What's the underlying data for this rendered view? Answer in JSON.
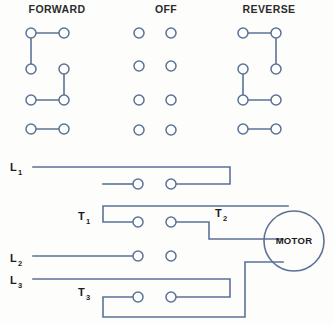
{
  "diagram": {
    "type": "electrical-switch-wiring-diagram",
    "background_color": "#fdfdfc",
    "wire_color": "#5b7296",
    "text_color": "#1b1b1b",
    "switch_positions": [
      {
        "id": "forward",
        "title": "FORWARD",
        "title_x": 57,
        "title_y": 13,
        "left_col_x": 31,
        "right_col_x": 64,
        "row_y": [
          33,
          69,
          100,
          129
        ],
        "contact_radius": 5,
        "jumpers": [
          {
            "from": [
              31,
              33
            ],
            "to": [
              64,
              33
            ]
          },
          {
            "from": [
              31,
              33
            ],
            "to": [
              31,
              69
            ]
          },
          {
            "from": [
              64,
              69
            ],
            "to": [
              64,
              100
            ]
          },
          {
            "from": [
              31,
              100
            ],
            "to": [
              64,
              100
            ]
          },
          {
            "from": [
              31,
              129
            ],
            "to": [
              64,
              129
            ]
          }
        ]
      },
      {
        "id": "off",
        "title": "OFF",
        "title_x": 166,
        "title_y": 13,
        "left_col_x": 139,
        "right_col_x": 171,
        "row_y": [
          33,
          66,
          100,
          130
        ],
        "contact_radius": 5,
        "jumpers": []
      },
      {
        "id": "reverse",
        "title": "REVERSE",
        "title_x": 269,
        "title_y": 13,
        "left_col_x": 243,
        "right_col_x": 276,
        "row_y": [
          33,
          69,
          100,
          129
        ],
        "contact_radius": 5,
        "jumpers": [
          {
            "from": [
              243,
              33
            ],
            "to": [
              276,
              33
            ]
          },
          {
            "from": [
              276,
              33
            ],
            "to": [
              276,
              69
            ]
          },
          {
            "from": [
              243,
              69
            ],
            "to": [
              243,
              100
            ]
          },
          {
            "from": [
              243,
              100
            ],
            "to": [
              276,
              100
            ]
          },
          {
            "from": [
              243,
              129
            ],
            "to": [
              276,
              129
            ]
          }
        ]
      }
    ],
    "circuit": {
      "motor": {
        "label": "MOTOR",
        "center_x": 294,
        "center_y": 241,
        "radius": 30
      },
      "terminals": [
        {
          "id": "L1",
          "letter": "L",
          "subscript": "1",
          "x": 10,
          "y": 171
        },
        {
          "id": "T1",
          "letter": "T",
          "subscript": "1",
          "x": 78,
          "y": 220
        },
        {
          "id": "T2",
          "letter": "T",
          "subscript": "2",
          "x": 215,
          "y": 217
        },
        {
          "id": "L2",
          "letter": "L",
          "subscript": "2",
          "x": 10,
          "y": 262
        },
        {
          "id": "L3",
          "letter": "L",
          "subscript": "3",
          "x": 10,
          "y": 284
        },
        {
          "id": "T3",
          "letter": "T",
          "subscript": "3",
          "x": 78,
          "y": 296
        }
      ],
      "contacts": [
        {
          "id": "c-L1-left",
          "x": 138,
          "y": 184,
          "r": 5
        },
        {
          "id": "c-L1-right",
          "x": 171,
          "y": 184,
          "r": 5
        },
        {
          "id": "c-T1-left",
          "x": 138,
          "y": 222,
          "r": 5
        },
        {
          "id": "c-T1-right",
          "x": 171,
          "y": 222,
          "r": 5
        },
        {
          "id": "c-L2-left",
          "x": 138,
          "y": 256,
          "r": 5
        },
        {
          "id": "c-L2-right",
          "x": 171,
          "y": 256,
          "r": 5
        },
        {
          "id": "c-T3-left",
          "x": 138,
          "y": 297,
          "r": 5
        },
        {
          "id": "c-T3-right",
          "x": 171,
          "y": 297,
          "r": 5
        }
      ],
      "wire_paths": [
        {
          "id": "wire-L1",
          "d": "M 33 167 L 230 167 L 230 184 L 176 184"
        },
        {
          "id": "wire-L1-stub",
          "d": "M 103 184 L 133 184"
        },
        {
          "id": "wire-T1",
          "d": "M 133 222 L 103 222 L 103 206 L 288 206"
        },
        {
          "id": "wire-T2",
          "d": "M 176 222 L 209 222 L 209 239 L 283 239"
        },
        {
          "id": "wire-L2",
          "d": "M 33 256 L 133 256"
        },
        {
          "id": "wire-L3",
          "d": "M 33 279 L 230 279 L 230 297 L 176 297"
        },
        {
          "id": "wire-T3",
          "d": "M 133 297 L 103 297 L 103 317 L 245 317 L 245 262 L 283 262"
        }
      ]
    }
  }
}
